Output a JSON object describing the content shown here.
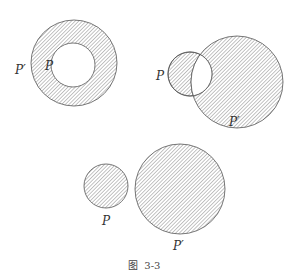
{
  "figure": {
    "caption": "图  3-3",
    "colors": {
      "stroke": "#555555",
      "hatch": "#7a7a7a",
      "background": "#ffffff"
    },
    "panels": [
      {
        "id": "nested",
        "description": "P inside P'; region P' hatched (annulus)",
        "labels": {
          "outer": "P′",
          "inner": "P"
        }
      },
      {
        "id": "overlapping",
        "description": "P and P' overlap; symmetric difference hatched, intersection white",
        "labels": {
          "small": "P",
          "large": "P′"
        }
      },
      {
        "id": "disjoint",
        "description": "P and P' disjoint; both hatched",
        "labels": {
          "small": "P",
          "large": "P′"
        }
      }
    ]
  }
}
